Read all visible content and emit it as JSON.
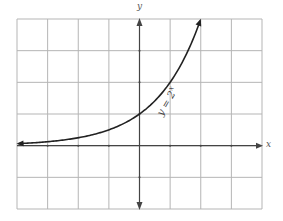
{
  "chart_data": {
    "type": "line",
    "title": "",
    "xlabel": "x",
    "ylabel": "y",
    "function": "y = 2^x",
    "curve_label": {
      "base": "y = 2",
      "exponent": "x"
    },
    "xlim": [
      -4,
      4
    ],
    "ylim": [
      -2,
      4
    ],
    "grid": true,
    "grid_step": 1,
    "tick_labels": false,
    "series": [
      {
        "name": "y = 2^x",
        "x": [
          -4,
          -3,
          -2,
          -1,
          0,
          1,
          2
        ],
        "y": [
          0.0625,
          0.125,
          0.25,
          0.5,
          1,
          2,
          4
        ],
        "arrow_left": true,
        "arrow_right": true
      }
    ],
    "axes_arrows": {
      "x_positive": true,
      "y_positive": true,
      "y_negative": true
    }
  },
  "colors": {
    "grid": "#b5b5b5",
    "axis": "#444444",
    "curve": "#222222",
    "background": "#ffffff"
  }
}
